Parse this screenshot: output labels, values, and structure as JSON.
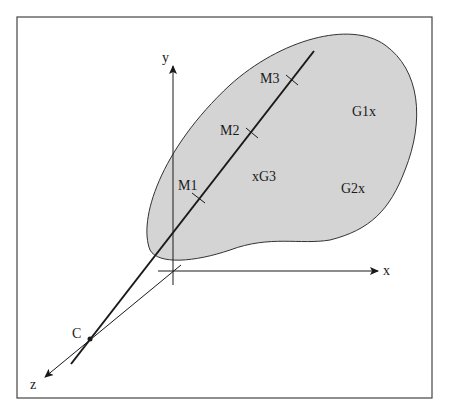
{
  "figure": {
    "type": "3d-coordinate-diagram",
    "axes": {
      "x_label": "x",
      "y_label": "y",
      "z_label": "z"
    },
    "camera_point_label": "C",
    "line_points": [
      {
        "id": "M1",
        "label": "M1"
      },
      {
        "id": "M2",
        "label": "M2"
      },
      {
        "id": "M3",
        "label": "M3"
      }
    ],
    "centroids": [
      {
        "id": "G1",
        "label": "G1x"
      },
      {
        "id": "G2",
        "label": "G2x"
      },
      {
        "id": "G3",
        "label": "xG3"
      }
    ],
    "colors": {
      "region_fill": "#d4d4d4",
      "stroke": "#1a1a1a",
      "frame": "#444444"
    }
  }
}
